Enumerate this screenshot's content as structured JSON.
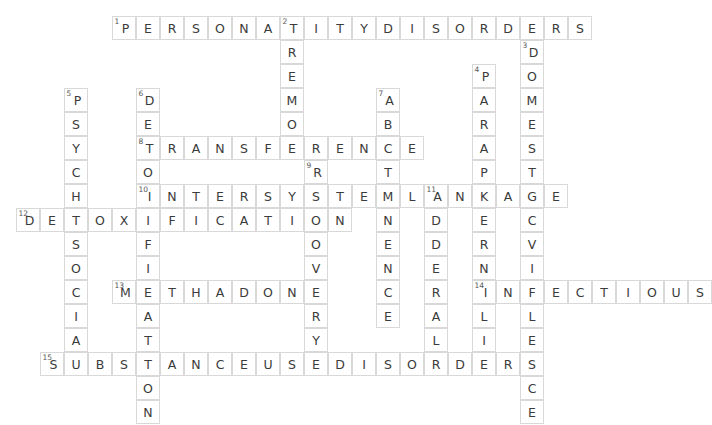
{
  "puzzle": {
    "type": "crossword",
    "cell_size": 24,
    "origin": {
      "x": 16,
      "y": 16
    },
    "grid_cols": 29,
    "grid_rows": 15,
    "entries": [
      {
        "number": "1",
        "direction": "across",
        "row": 0,
        "col": 4,
        "answer": "PERSONALITYDISORDERS"
      },
      {
        "number": "2",
        "direction": "down",
        "row": 0,
        "col": 11,
        "answer": "TREMOR"
      },
      {
        "number": "3",
        "direction": "down",
        "row": 1,
        "col": 21,
        "answer": "DOMESTICVIOLENCE"
      },
      {
        "number": "4",
        "direction": "down",
        "row": 2,
        "col": 19,
        "answer": "PARAPHERNALIA"
      },
      {
        "number": "5",
        "direction": "down",
        "row": 3,
        "col": 2,
        "answer": "PSYCHOSOCIAL"
      },
      {
        "number": "6",
        "direction": "down",
        "row": 3,
        "col": 5,
        "answer": "DETOXIFICATION"
      },
      {
        "number": "7",
        "direction": "down",
        "row": 3,
        "col": 15,
        "answer": "ABSTINENCE"
      },
      {
        "number": "8",
        "direction": "across",
        "row": 5,
        "col": 5,
        "answer": "TRANSFERENCE"
      },
      {
        "number": "9",
        "direction": "down",
        "row": 6,
        "col": 12,
        "answer": "RECOVERY"
      },
      {
        "number": "10",
        "direction": "across",
        "row": 7,
        "col": 5,
        "answer": "INTERSYSTEMLINKAGE"
      },
      {
        "number": "11",
        "direction": "down",
        "row": 7,
        "col": 17,
        "answer": "ADDERALL"
      },
      {
        "number": "12",
        "direction": "across",
        "row": 8,
        "col": 0,
        "answer": "DETOXIFICATION"
      },
      {
        "number": "13",
        "direction": "across",
        "row": 11,
        "col": 4,
        "answer": "METHADONE"
      },
      {
        "number": "14",
        "direction": "across",
        "row": 11,
        "col": 19,
        "answer": "INFECTIOUS"
      },
      {
        "number": "15",
        "direction": "across",
        "row": 14,
        "col": 1,
        "answer": "SUBSTANCEUSEDISORDERS"
      }
    ],
    "colors": {
      "cell_border": "#d8d8d8",
      "cell_fill": "#ffffff",
      "letter": "#3b3b3b",
      "number": "#555555",
      "page_background": "#ffffff"
    }
  }
}
